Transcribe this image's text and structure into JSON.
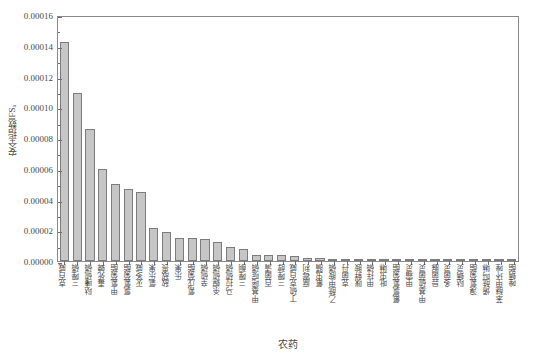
{
  "chart_data": {
    "type": "bar",
    "title": "",
    "xlabel": "农药",
    "ylabel": "安全指数IFSₐ",
    "ylim": [
      0,
      0.00016
    ],
    "ytick_values": [
      0.0,
      2e-05,
      4e-05,
      6e-05,
      8e-05,
      0.0001,
      0.00012,
      0.00014,
      0.00016
    ],
    "ytick_labels": [
      "0.00000",
      "0.00002",
      "0.00004",
      "0.00006",
      "0.00008",
      "0.00010",
      "0.00012",
      "0.00014",
      "0.00016"
    ],
    "grid": false,
    "legend": null,
    "bar_color": "#c6c6c6",
    "bar_edge_color": "#7c7c7c",
    "categories": [
      "克百威",
      "三唑磷",
      "哒嗪硫磷",
      "毒死蜱",
      "甲氰菊酯",
      "氯氰菊酯",
      "灭多威",
      "氧乐果",
      "敌敌畏",
      "乐果",
      "氰戊菊酯",
      "辛硫磷",
      "杀螟硫磷",
      "马拉硫磷",
      "三唑酮",
      "甲基嘧啶磷",
      "百菌清",
      "三唑醇",
      "丁硫克百威",
      "腐霉利",
      "氟虫腈",
      "乙酰甲胺磷",
      "克菌丹",
      "咪鲜胺",
      "甲拌磷",
      "吡虫啉",
      "氟氯氰菊酯",
      "甲霜灵",
      "甲基硫菌灵",
      "异菌脲",
      "多菌灵",
      "哒螨灵",
      "溴氰菊酯",
      "烯酰吗啉",
      "苯醚甲环唑",
      "唑螨酯"
    ],
    "values": [
      0.0001425,
      0.000109,
      8.6e-05,
      6e-05,
      5e-05,
      4.7e-05,
      4.5e-05,
      2.12e-05,
      1.9e-05,
      1.5e-05,
      1.5e-05,
      1.4e-05,
      1.25e-05,
      8.8e-06,
      8e-06,
      4.2e-06,
      4e-06,
      3.8e-06,
      3.2e-06,
      2.2e-06,
      2e-06,
      1.4e-06,
      1.2e-06,
      1e-06,
      9e-07,
      8e-07,
      7e-07,
      6e-07,
      5e-07,
      4e-07,
      4e-07,
      3e-07,
      3e-07,
      2e-07,
      2e-07,
      1e-07
    ]
  }
}
